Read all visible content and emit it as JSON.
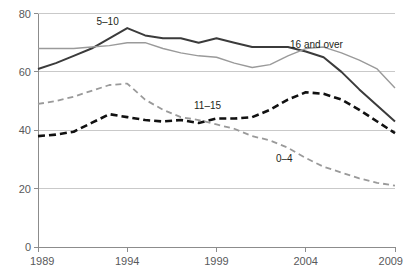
{
  "chart_data": {
    "type": "line",
    "title": "",
    "subtitle": "",
    "xlabel": "",
    "ylabel": "",
    "xlim": [
      1989,
      2009
    ],
    "ylim": [
      0,
      80
    ],
    "yticks": [
      0,
      20,
      40,
      60,
      80
    ],
    "ytick_labels": [
      "0",
      "20",
      "40",
      "60",
      "80"
    ],
    "xticks": [
      1989,
      1994,
      1999,
      2004,
      2009
    ],
    "xtick_labels": [
      "1989",
      "1994",
      "1999",
      "2004",
      "2009"
    ],
    "grid": "horizontal",
    "legend": "inline-annotations",
    "x": [
      1989,
      1990,
      1991,
      1992,
      1993,
      1994,
      1995,
      1996,
      1997,
      1998,
      1999,
      2000,
      2001,
      2002,
      2003,
      2004,
      2005,
      2006,
      2007,
      2008,
      2009
    ],
    "series": [
      {
        "name": "5-10",
        "label": "5–10",
        "color": "#3b3b3b",
        "style": "solid",
        "width": 2,
        "label_x": 1992.9,
        "label_y": 77.5,
        "values": [
          61,
          63,
          65.5,
          68,
          71.5,
          75,
          72.5,
          71.5,
          71.5,
          70,
          71.5,
          70,
          68.5,
          68.5,
          68.5,
          67,
          65,
          60,
          54,
          48.5,
          43
        ]
      },
      {
        "name": "16 and over",
        "label": "16 and over",
        "color": "#9a9a9a",
        "style": "solid",
        "width": 1.4,
        "label_x": 2004.6,
        "label_y": 69.5,
        "values": [
          68,
          68,
          68,
          68.5,
          69,
          70,
          70,
          68,
          66.5,
          65.5,
          65,
          63,
          61.5,
          62.5,
          65.5,
          68,
          68.5,
          66.5,
          64,
          61,
          54.5
        ]
      },
      {
        "name": "11-15",
        "label": "11–15",
        "color": "#111111",
        "style": "dashed",
        "width": 2.6,
        "label_x": 1998.5,
        "label_y": 48.5,
        "values": [
          38,
          38.5,
          39.5,
          42.5,
          45.5,
          44.5,
          43.5,
          43,
          43.5,
          42.5,
          44,
          44,
          44.5,
          47,
          50.5,
          53,
          52.5,
          50.5,
          47,
          43,
          39
        ]
      },
      {
        "name": "0-4",
        "label": "0–4",
        "color": "#9a9a9a",
        "style": "dashed",
        "width": 1.8,
        "label_x": 2002.8,
        "label_y": 30.5,
        "values": [
          49,
          50,
          51.5,
          53.5,
          55.5,
          56,
          50.5,
          47,
          44.5,
          43.5,
          42,
          40.5,
          38,
          36.5,
          34,
          30.5,
          27.5,
          25.5,
          23.5,
          22,
          21
        ]
      }
    ]
  },
  "axes": {
    "y_axis_name": "y-axis",
    "x_axis_name": "x-axis"
  }
}
